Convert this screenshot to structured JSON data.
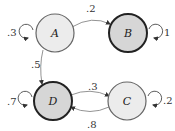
{
  "diagram": {
    "type": "markov-chain",
    "nodes": [
      {
        "id": "A",
        "label": "A",
        "fill": "#ececec",
        "stroke": "#555555",
        "stroke_width": 1.2
      },
      {
        "id": "B",
        "label": "B",
        "fill": "#d6d6d6",
        "stroke": "#222222",
        "stroke_width": 2
      },
      {
        "id": "C",
        "label": "C",
        "fill": "#ececec",
        "stroke": "#555555",
        "stroke_width": 1.2
      },
      {
        "id": "D",
        "label": "D",
        "fill": "#d6d6d6",
        "stroke": "#222222",
        "stroke_width": 2
      }
    ],
    "edges": [
      {
        "from": "A",
        "to": "B",
        "label": ".2"
      },
      {
        "from": "A",
        "to": "D",
        "label": ".5"
      },
      {
        "from": "D",
        "to": "C",
        "label": ".3"
      },
      {
        "from": "C",
        "to": "D",
        "label": ".8"
      }
    ],
    "self_loops": [
      {
        "node": "A",
        "label": ".3"
      },
      {
        "node": "B",
        "label": "1"
      },
      {
        "node": "C",
        "label": ".2"
      },
      {
        "node": "D",
        "label": ".7"
      }
    ]
  }
}
